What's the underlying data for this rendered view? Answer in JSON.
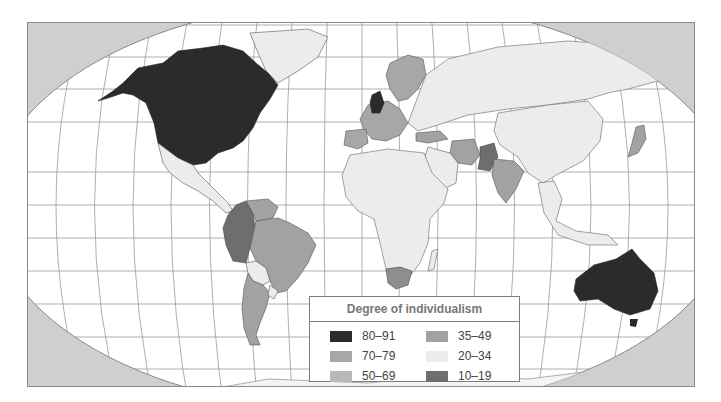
{
  "map": {
    "type": "choropleth world map",
    "projection": "Robinson-like",
    "colors": {
      "ocean": "#ffffff",
      "outside_globe": "#cfcfcf",
      "gridline": "#9a9a9a",
      "border": "#555555"
    }
  },
  "legend": {
    "title": "Degree of individualism",
    "items": [
      {
        "label": "80–91",
        "color": "#2b2b2b"
      },
      {
        "label": "70–79",
        "color": "#a7a7a7"
      },
      {
        "label": "50–69",
        "color": "#b9b9b9"
      },
      {
        "label": "35–49",
        "color": "#a2a2a2"
      },
      {
        "label": "20–34",
        "color": "#ececec"
      },
      {
        "label": "10–19",
        "color": "#6e6e6e"
      }
    ]
  },
  "regions": [
    {
      "name": "United States & Canada",
      "class": "80–91"
    },
    {
      "name": "Australia",
      "class": "80–91"
    },
    {
      "name": "United Kingdom",
      "class": "80–91"
    },
    {
      "name": "Western & Northern Europe",
      "class": "70–79"
    },
    {
      "name": "Iran / Turkey / India",
      "class": "35–49"
    },
    {
      "name": "Pakistan",
      "class": "10–19"
    },
    {
      "name": "Colombia / Ecuador / Peru",
      "class": "10–19"
    },
    {
      "name": "Brazil / Argentina / Venezuela",
      "class": "35–49"
    },
    {
      "name": "South Africa",
      "class": "50–69"
    },
    {
      "name": "Japan",
      "class": "35–49"
    },
    {
      "name": "Mexico, Africa, Asia, others",
      "class": "20–34"
    }
  ]
}
